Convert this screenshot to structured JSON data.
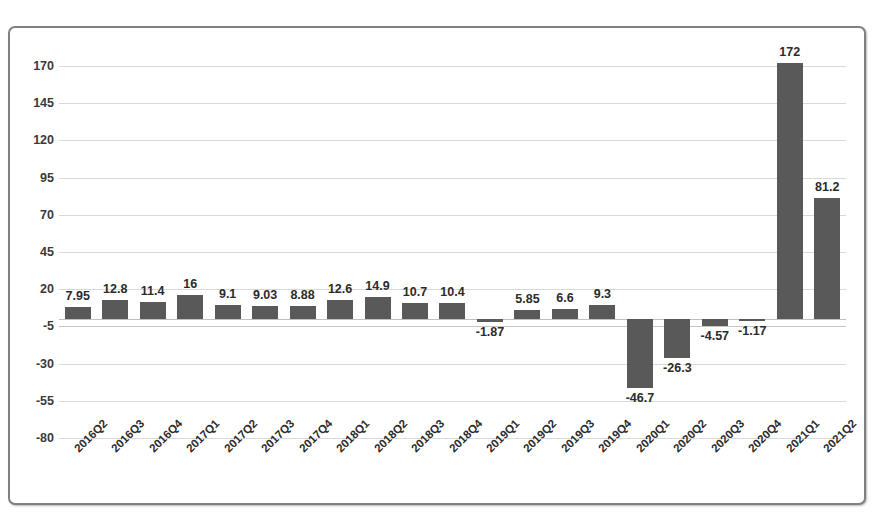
{
  "chart_data": {
    "type": "bar",
    "title": "",
    "subtitle": "",
    "xlabel": "",
    "ylabel": "",
    "ylim": [
      -80,
      170
    ],
    "ytick_step": 25,
    "yticks": [
      170,
      145,
      120,
      95,
      70,
      45,
      20,
      -5,
      -30,
      -55,
      -80
    ],
    "grid": true,
    "legend": false,
    "legend_position": "none",
    "bar_color": "#595959",
    "gridline_color": "#d9d9d9",
    "border_color": "#808080",
    "categories": [
      "2016Q2",
      "2016Q3",
      "2016Q4",
      "2017Q1",
      "2017Q2",
      "2017Q3",
      "2017Q4",
      "2018Q1",
      "2018Q2",
      "2018Q3",
      "2018Q4",
      "2019Q1",
      "2019Q2",
      "2019Q3",
      "2019Q4",
      "2020Q1",
      "2020Q2",
      "2020Q3",
      "2020Q4",
      "2021Q1",
      "2021Q2"
    ],
    "values": [
      7.95,
      12.8,
      11.4,
      16,
      9.1,
      9.03,
      8.88,
      12.6,
      14.9,
      10.7,
      10.4,
      -1.87,
      5.85,
      6.6,
      9.3,
      -46.7,
      -26.3,
      -4.57,
      -1.17,
      172,
      81.2
    ],
    "value_labels": [
      "7.95",
      "12.8",
      "11.4",
      "16",
      "9.1",
      "9.03",
      "8.88",
      "12.6",
      "14.9",
      "10.7",
      "10.4",
      "-1.87",
      "5.85",
      "6.6",
      "9.3",
      "-46.7",
      "-26.3",
      "-4.57",
      "-1.17",
      "172",
      "81.2"
    ]
  }
}
